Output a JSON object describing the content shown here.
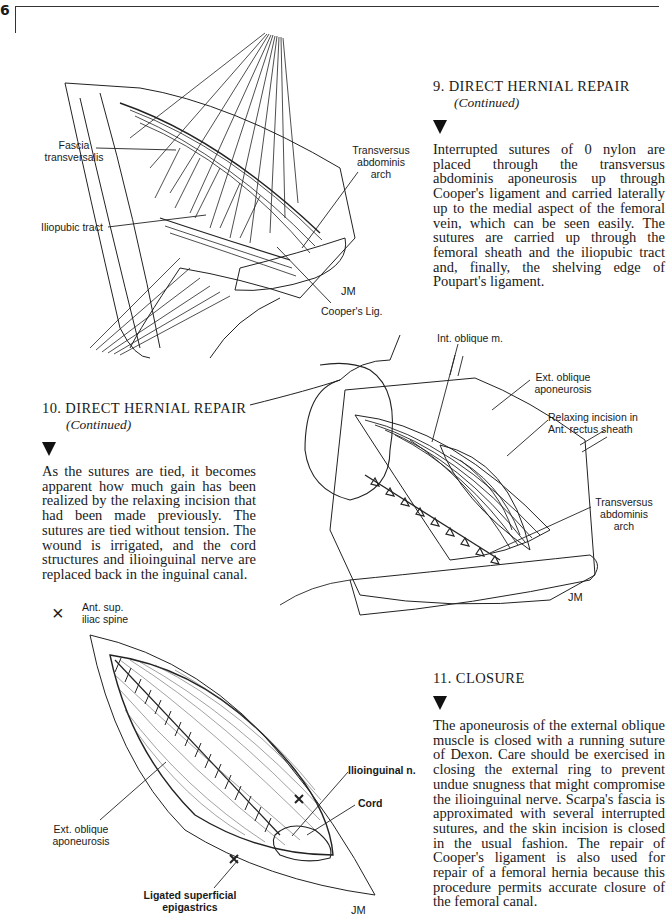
{
  "page": {
    "number": "6"
  },
  "sections": [
    {
      "id": "step9",
      "number": "9.",
      "title": "DIRECT HERNIAL REPAIR",
      "subtitle": "(Continued)",
      "body": "Interrupted sutures of 0 nylon are placed through the transversus abdominis aponeurosis up through Cooper's ligament and carried laterally up to the medial aspect of the femoral vein, which can be seen easily. The sutures are carried up through the femoral sheath and the iliopubic tract and, finally, the shelving edge of Poupart's ligament."
    },
    {
      "id": "step10",
      "number": "10.",
      "title": "DIRECT HERNIAL REPAIR",
      "subtitle": "(Continued)",
      "body": "As the sutures are tied, it becomes apparent how much gain has been realized by the relaxing incision that had been made previously. The sutures are tied without tension. The wound is irrigated, and the cord structures and ilioinguinal nerve are replaced back in the inguinal canal."
    },
    {
      "id": "step11",
      "number": "11.",
      "title": "CLOSURE",
      "subtitle": "",
      "body": "The aponeurosis of the external oblique muscle is closed with a running suture of Dexon. Care should be exercised in closing the external ring to prevent undue snugness that might compromise the ilioinguinal nerve. Scarpa's fascia is approximated with several interrupted sutures, and the skin incision is closed in the usual fashion. The repair of Cooper's ligament is also used for repair of a femoral hernia because this procedure permits accurate closure of the femoral canal."
    }
  ],
  "figures": [
    {
      "id": "fig9",
      "labels": {
        "fascia_transversalis": "Fascia\ntransversalis",
        "iliopubic_tract": "Iliopubic tract",
        "transversus_abdominis_arch": "Transversus\nabdominis\narch",
        "coopers_lig": "Cooper's Lig."
      },
      "signature": "JM"
    },
    {
      "id": "fig10",
      "labels": {
        "int_oblique": "Int. oblique m.",
        "ext_oblique_aponeurosis": "Ext. oblique\naponeurosis",
        "relaxing_incision": "Relaxing incision in\nAnt. rectus sheath",
        "transversus_abdominis_arch": "Transversus\nabdominis\narch"
      },
      "signature": "JM"
    },
    {
      "id": "fig11",
      "labels": {
        "ant_sup_iliac_spine": "Ant. sup.\niliac spine",
        "ilioinguinal_n": "Ilioinguinal n.",
        "cord": "Cord",
        "ext_oblique_aponeurosis": "Ext. oblique\naponeurosis",
        "ligated_epigastrics": "Ligated superficial\nepigastrics"
      },
      "marker_symbol": "×",
      "signature": "JM"
    }
  ]
}
